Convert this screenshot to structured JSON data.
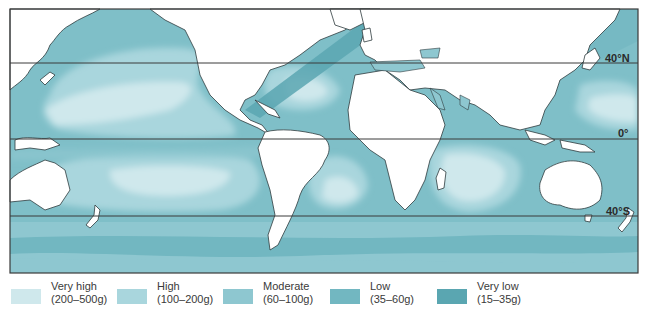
{
  "map": {
    "title": "",
    "latitude_lines": [
      {
        "label": "40°N",
        "y": 63
      },
      {
        "label": "0°",
        "y": 139
      },
      {
        "label": "40°S",
        "y": 216
      }
    ],
    "colors": {
      "land": "#ffffff",
      "coast": "#2f3b3e",
      "very_high": "#cfe8ec",
      "high": "#a9d6dd",
      "moderate": "#8ec7d0",
      "low": "#72b7c1",
      "very_low": "#5aa6b1",
      "frame": "#3a3a3a"
    }
  },
  "legend": {
    "items": [
      {
        "name": "Very high",
        "range": "(200–500g)",
        "color": "#cfe8ec"
      },
      {
        "name": "High",
        "range": "(100–200g)",
        "color": "#a9d6dd"
      },
      {
        "name": "Moderate",
        "range": "(60–100g)",
        "color": "#8ec7d0"
      },
      {
        "name": "Low",
        "range": "(35–60g)",
        "color": "#72b7c1"
      },
      {
        "name": "Very low",
        "range": "(15–35g)",
        "color": "#5aa6b1"
      }
    ]
  }
}
